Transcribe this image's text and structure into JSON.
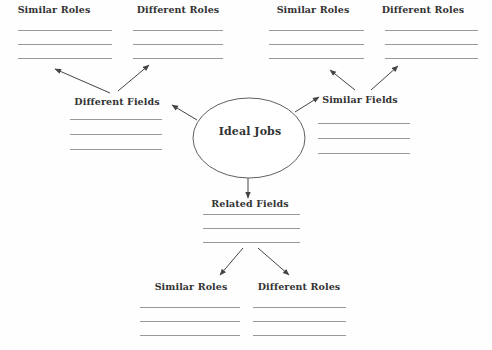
{
  "center": {
    "label": "Ideal Jobs"
  },
  "fields": {
    "different": "Different Fields",
    "similar": "Similar Fields",
    "related": "Related Fields"
  },
  "role_groups": {
    "top_left": {
      "similar": "Similar Roles",
      "different": "Different Roles"
    },
    "top_right": {
      "similar": "Similar Roles",
      "different": "Different Roles"
    },
    "bottom": {
      "similar": "Similar Roles",
      "different": "Different Roles"
    }
  },
  "blank_lines": {
    "count": 3
  },
  "edges": [
    {
      "from": "Ideal Jobs",
      "to": "Different Fields"
    },
    {
      "from": "Ideal Jobs",
      "to": "Similar Fields"
    },
    {
      "from": "Ideal Jobs",
      "to": "Related Fields"
    },
    {
      "from": "Different Fields",
      "to": "Similar Roles"
    },
    {
      "from": "Different Fields",
      "to": "Different Roles"
    },
    {
      "from": "Similar Fields",
      "to": "Similar Roles"
    },
    {
      "from": "Similar Fields",
      "to": "Different Roles"
    },
    {
      "from": "Related Fields",
      "to": "Similar Roles"
    },
    {
      "from": "Related Fields",
      "to": "Different Roles"
    }
  ],
  "colors": {
    "background": "#fefefe",
    "text": "#333333",
    "blank_line": "#999999",
    "arrow": "#444444",
    "ellipse_border": "#606060"
  }
}
